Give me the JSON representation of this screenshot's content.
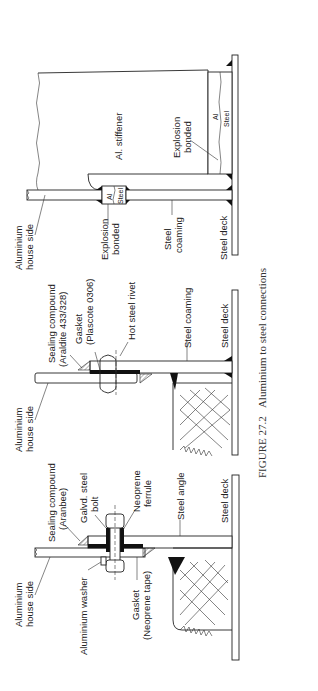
{
  "figure": {
    "caption_prefix": "FIGURE 27.2",
    "caption_text": "Aluminium to steel connections",
    "orientation": "rotated 90° counter-clockwise"
  },
  "details": [
    {
      "name": "bolted-connection",
      "labels": {
        "house_side_1": "Aluminium",
        "house_side_2": "house side",
        "sealing_1": "Sealing compound",
        "sealing_2": "(Aranbee)",
        "bolt_1": "Galvd. steel",
        "bolt_2": "bolt",
        "ferrule_1": "Neoprene",
        "ferrule_2": "ferrule",
        "washer": "Aluminium washer",
        "gasket_1": "Gasket",
        "gasket_2": "(Neoprene tape)",
        "angle": "Steel angle",
        "deck": "Steel deck"
      }
    },
    {
      "name": "riveted-connection",
      "labels": {
        "house_side_1": "Aluminium",
        "house_side_2": "house side",
        "sealing_1": "Sealing compound",
        "sealing_2": "(Araldite 433/328)",
        "gasket_1": "Gasket",
        "gasket_2": "(Plascote 0306)",
        "rivet": "Hot steel rivet",
        "coaming": "Steel coaming",
        "deck": "Steel deck"
      }
    },
    {
      "name": "explosion-bonded-connection",
      "labels": {
        "house_side_1": "Aluminium",
        "house_side_2": "house side",
        "bonded_1": "Explosion",
        "bonded_2": "bonded",
        "coaming_1": "Steel",
        "coaming_2": "coaming",
        "deck": "Steel deck",
        "stiffener": "Al. stiffener",
        "bonded2_1": "Explosion",
        "bonded2_2": "bonded",
        "al": "Al",
        "steel": "Steel",
        "al_b": "Al",
        "steel_b": "Steel"
      }
    }
  ]
}
